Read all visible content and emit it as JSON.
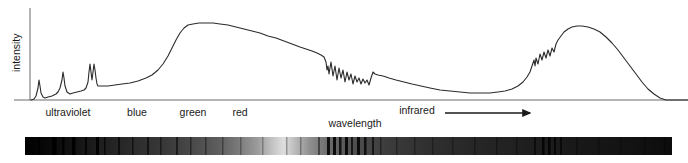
{
  "figure": {
    "type": "spectrum-diagram",
    "background": "#ffffff",
    "line_color": "#2b2b2b",
    "axis_color": "#6b6b6b",
    "text_color": "#1a1a1a"
  },
  "axes": {
    "y_label": "intensity",
    "x_label": "wavelength",
    "y_axis_x": 30,
    "y_axis_top": 8,
    "baseline_y": 100,
    "x_axis_left": 14,
    "x_axis_right": 688
  },
  "band_labels": [
    {
      "text": "ultraviolet",
      "x": 68,
      "y": 116
    },
    {
      "text": "blue",
      "x": 137,
      "y": 116
    },
    {
      "text": "green",
      "x": 193,
      "y": 116
    },
    {
      "text": "red",
      "x": 240,
      "y": 116
    },
    {
      "text": "infrared",
      "x": 417,
      "y": 114
    }
  ],
  "x_axis_caption": {
    "text": "wavelength",
    "x": 355,
    "y": 127
  },
  "infrared_arrow": {
    "x_start": 445,
    "x_end": 530,
    "y": 113,
    "head_size": 5
  },
  "chart_data": {
    "type": "line",
    "title": "",
    "xlabel": "wavelength",
    "ylabel": "intensity",
    "xlim": [
      0,
      688
    ],
    "ylim": [
      0,
      100
    ],
    "grid": false,
    "legend": "none",
    "annotations": [
      "ultraviolet",
      "blue",
      "green",
      "red",
      "infrared"
    ],
    "series": [
      {
        "name": "spectral intensity",
        "color": "#2b2b2b",
        "points": [
          [
            31,
            100
          ],
          [
            34,
            99
          ],
          [
            36,
            96
          ],
          [
            38,
            88
          ],
          [
            39,
            80
          ],
          [
            40,
            86
          ],
          [
            41,
            93
          ],
          [
            43,
            97
          ],
          [
            45,
            98
          ],
          [
            48,
            97
          ],
          [
            52,
            96
          ],
          [
            56,
            94
          ],
          [
            58,
            92
          ],
          [
            60,
            88
          ],
          [
            62,
            80
          ],
          [
            63,
            72
          ],
          [
            64,
            78
          ],
          [
            65,
            86
          ],
          [
            67,
            92
          ],
          [
            70,
            94
          ],
          [
            73,
            93
          ],
          [
            77,
            92
          ],
          [
            81,
            91
          ],
          [
            84,
            90
          ],
          [
            86,
            88
          ],
          [
            88,
            82
          ],
          [
            89,
            72
          ],
          [
            90,
            64
          ],
          [
            91,
            72
          ],
          [
            92,
            80
          ],
          [
            93,
            72
          ],
          [
            94,
            64
          ],
          [
            95,
            70
          ],
          [
            96,
            78
          ],
          [
            97,
            84
          ],
          [
            98,
            86
          ],
          [
            102,
            86
          ],
          [
            108,
            86
          ],
          [
            115,
            85
          ],
          [
            122,
            84
          ],
          [
            130,
            83
          ],
          [
            138,
            81
          ],
          [
            146,
            78
          ],
          [
            152,
            75
          ],
          [
            158,
            70
          ],
          [
            163,
            64
          ],
          [
            168,
            56
          ],
          [
            172,
            48
          ],
          [
            176,
            40
          ],
          [
            180,
            33
          ],
          [
            184,
            28
          ],
          [
            188,
            25
          ],
          [
            193,
            24
          ],
          [
            199,
            23
          ],
          [
            206,
            23
          ],
          [
            213,
            23
          ],
          [
            220,
            24
          ],
          [
            228,
            25
          ],
          [
            236,
            27
          ],
          [
            244,
            29
          ],
          [
            252,
            31
          ],
          [
            260,
            33
          ],
          [
            268,
            36
          ],
          [
            276,
            38
          ],
          [
            284,
            41
          ],
          [
            292,
            44
          ],
          [
            300,
            47
          ],
          [
            306,
            49
          ],
          [
            312,
            51
          ],
          [
            317,
            53
          ],
          [
            321,
            55
          ],
          [
            324,
            57
          ],
          [
            326,
            62
          ],
          [
            327,
            70
          ],
          [
            328,
            66
          ],
          [
            329,
            74
          ],
          [
            331,
            62
          ],
          [
            333,
            76
          ],
          [
            335,
            66
          ],
          [
            337,
            80
          ],
          [
            339,
            68
          ],
          [
            341,
            78
          ],
          [
            343,
            70
          ],
          [
            345,
            82
          ],
          [
            347,
            72
          ],
          [
            349,
            80
          ],
          [
            351,
            74
          ],
          [
            353,
            84
          ],
          [
            355,
            76
          ],
          [
            357,
            82
          ],
          [
            359,
            78
          ],
          [
            361,
            84
          ],
          [
            363,
            79
          ],
          [
            365,
            83
          ],
          [
            367,
            80
          ],
          [
            369,
            85
          ],
          [
            371,
            78
          ],
          [
            373,
            72
          ],
          [
            375,
            74
          ],
          [
            378,
            75
          ],
          [
            383,
            76
          ],
          [
            389,
            78
          ],
          [
            396,
            80
          ],
          [
            404,
            82
          ],
          [
            412,
            84
          ],
          [
            421,
            86
          ],
          [
            430,
            88
          ],
          [
            440,
            90
          ],
          [
            450,
            91
          ],
          [
            460,
            92
          ],
          [
            470,
            93
          ],
          [
            480,
            93
          ],
          [
            490,
            93
          ],
          [
            498,
            92
          ],
          [
            505,
            91
          ],
          [
            512,
            89
          ],
          [
            518,
            86
          ],
          [
            523,
            82
          ],
          [
            527,
            77
          ],
          [
            530,
            72
          ],
          [
            532,
            66
          ],
          [
            534,
            60
          ],
          [
            535,
            66
          ],
          [
            536,
            58
          ],
          [
            538,
            64
          ],
          [
            540,
            54
          ],
          [
            542,
            60
          ],
          [
            544,
            52
          ],
          [
            546,
            58
          ],
          [
            548,
            50
          ],
          [
            550,
            56
          ],
          [
            552,
            48
          ],
          [
            554,
            52
          ],
          [
            556,
            44
          ],
          [
            558,
            40
          ],
          [
            561,
            36
          ],
          [
            564,
            32
          ],
          [
            568,
            29
          ],
          [
            572,
            27
          ],
          [
            577,
            26
          ],
          [
            582,
            26
          ],
          [
            588,
            27
          ],
          [
            594,
            29
          ],
          [
            600,
            32
          ],
          [
            606,
            37
          ],
          [
            612,
            43
          ],
          [
            618,
            50
          ],
          [
            624,
            58
          ],
          [
            630,
            66
          ],
          [
            636,
            74
          ],
          [
            642,
            82
          ],
          [
            648,
            89
          ],
          [
            654,
            94
          ],
          [
            660,
            98
          ],
          [
            666,
            100
          ],
          [
            672,
            100
          ],
          [
            680,
            100
          ],
          [
            688,
            100
          ]
        ]
      }
    ]
  },
  "spectrum_bar": {
    "x": 25,
    "y": 137,
    "width": 647,
    "height": 18,
    "description": "grayscale continuum with dark absorption lines",
    "gradient_stops": [
      {
        "offset": 0,
        "color": "#000000"
      },
      {
        "offset": 0.04,
        "color": "#0a0a0a"
      },
      {
        "offset": 0.1,
        "color": "#1a1a1a"
      },
      {
        "offset": 0.16,
        "color": "#2a2a2a"
      },
      {
        "offset": 0.22,
        "color": "#3a3a3a"
      },
      {
        "offset": 0.26,
        "color": "#4a4a4a"
      },
      {
        "offset": 0.3,
        "color": "#5e5e5e"
      },
      {
        "offset": 0.33,
        "color": "#7a7a7a"
      },
      {
        "offset": 0.36,
        "color": "#9c9c9c"
      },
      {
        "offset": 0.385,
        "color": "#c8c8c8"
      },
      {
        "offset": 0.4,
        "color": "#dedede"
      },
      {
        "offset": 0.415,
        "color": "#c0c0c0"
      },
      {
        "offset": 0.44,
        "color": "#8f8f8f"
      },
      {
        "offset": 0.47,
        "color": "#6b6b6b"
      },
      {
        "offset": 0.51,
        "color": "#4e4e4e"
      },
      {
        "offset": 0.56,
        "color": "#3c3c3c"
      },
      {
        "offset": 0.62,
        "color": "#303030"
      },
      {
        "offset": 0.7,
        "color": "#262626"
      },
      {
        "offset": 0.78,
        "color": "#1e1e1e"
      },
      {
        "offset": 0.86,
        "color": "#181818"
      },
      {
        "offset": 0.94,
        "color": "#121212"
      },
      {
        "offset": 1.0,
        "color": "#0c0c0c"
      }
    ],
    "absorption_lines": [
      {
        "x": 28,
        "w": 3.0,
        "o": 0.95
      },
      {
        "x": 38,
        "w": 2.0,
        "o": 0.8
      },
      {
        "x": 52,
        "w": 4.5,
        "o": 0.96
      },
      {
        "x": 62,
        "w": 2.5,
        "o": 0.85
      },
      {
        "x": 72,
        "w": 3.5,
        "o": 0.92
      },
      {
        "x": 85,
        "w": 2.0,
        "o": 0.75
      },
      {
        "x": 96,
        "w": 3.0,
        "o": 0.9
      },
      {
        "x": 104,
        "w": 1.5,
        "o": 0.7
      },
      {
        "x": 118,
        "w": 2.0,
        "o": 0.65
      },
      {
        "x": 132,
        "w": 1.5,
        "o": 0.55
      },
      {
        "x": 147,
        "w": 2.0,
        "o": 0.6
      },
      {
        "x": 160,
        "w": 1.5,
        "o": 0.5
      },
      {
        "x": 176,
        "w": 2.0,
        "o": 0.55
      },
      {
        "x": 190,
        "w": 1.5,
        "o": 0.45
      },
      {
        "x": 205,
        "w": 1.5,
        "o": 0.4
      },
      {
        "x": 222,
        "w": 1.5,
        "o": 0.35
      },
      {
        "x": 240,
        "w": 1.5,
        "o": 0.3
      },
      {
        "x": 262,
        "w": 1.5,
        "o": 0.28
      },
      {
        "x": 286,
        "w": 1.5,
        "o": 0.3
      },
      {
        "x": 300,
        "w": 1.5,
        "o": 0.32
      },
      {
        "x": 318,
        "w": 2.0,
        "o": 0.45
      },
      {
        "x": 327,
        "w": 3.0,
        "o": 0.85
      },
      {
        "x": 333,
        "w": 3.0,
        "o": 0.88
      },
      {
        "x": 339,
        "w": 2.5,
        "o": 0.8
      },
      {
        "x": 345,
        "w": 3.0,
        "o": 0.86
      },
      {
        "x": 351,
        "w": 2.0,
        "o": 0.72
      },
      {
        "x": 357,
        "w": 3.0,
        "o": 0.84
      },
      {
        "x": 364,
        "w": 2.5,
        "o": 0.78
      },
      {
        "x": 372,
        "w": 2.0,
        "o": 0.66
      },
      {
        "x": 380,
        "w": 1.5,
        "o": 0.45
      },
      {
        "x": 396,
        "w": 1.5,
        "o": 0.35
      },
      {
        "x": 414,
        "w": 1.5,
        "o": 0.33
      },
      {
        "x": 432,
        "w": 1.5,
        "o": 0.3
      },
      {
        "x": 452,
        "w": 1.5,
        "o": 0.3
      },
      {
        "x": 474,
        "w": 1.5,
        "o": 0.32
      },
      {
        "x": 496,
        "w": 1.5,
        "o": 0.34
      },
      {
        "x": 516,
        "w": 1.5,
        "o": 0.36
      },
      {
        "x": 534,
        "w": 2.0,
        "o": 0.55
      },
      {
        "x": 542,
        "w": 2.5,
        "o": 0.8
      },
      {
        "x": 548,
        "w": 2.5,
        "o": 0.82
      },
      {
        "x": 554,
        "w": 2.0,
        "o": 0.72
      },
      {
        "x": 560,
        "w": 2.0,
        "o": 0.6
      },
      {
        "x": 576,
        "w": 1.5,
        "o": 0.35
      },
      {
        "x": 598,
        "w": 1.5,
        "o": 0.3
      },
      {
        "x": 620,
        "w": 1.5,
        "o": 0.28
      },
      {
        "x": 644,
        "w": 1.5,
        "o": 0.26
      },
      {
        "x": 664,
        "w": 1.5,
        "o": 0.24
      }
    ]
  }
}
